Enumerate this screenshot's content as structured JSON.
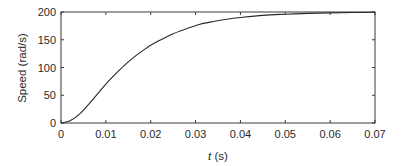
{
  "chart_data": {
    "type": "line",
    "title": "",
    "xlabel_var": "t",
    "xlabel_unit": " (s)",
    "xlabel": "t (s)",
    "ylabel": "Speed (rad/s)",
    "xlim": [
      0,
      0.07
    ],
    "ylim": [
      0,
      200
    ],
    "grid": false,
    "legend": null,
    "x_ticks": [
      0,
      0.01,
      0.02,
      0.03,
      0.04,
      0.05,
      0.06,
      0.07
    ],
    "x_tick_labels": [
      "0",
      "0.01",
      "0.02",
      "0.03",
      "0.04",
      "0.05",
      "0.06",
      "0.07"
    ],
    "y_ticks": [
      0,
      50,
      100,
      150,
      200
    ],
    "y_tick_labels": [
      "0",
      "50",
      "100",
      "150",
      "200"
    ],
    "series": [
      {
        "name": "Speed",
        "color": "#2a2a2a",
        "x": [
          0,
          0.002,
          0.004,
          0.006,
          0.008,
          0.01,
          0.012,
          0.014,
          0.016,
          0.018,
          0.02,
          0.022,
          0.025,
          0.028,
          0.031,
          0.034,
          0.037,
          0.04,
          0.045,
          0.05,
          0.055,
          0.06,
          0.065,
          0.07
        ],
        "values": [
          0,
          4,
          15,
          32,
          51,
          70,
          87,
          103,
          117,
          129,
          140,
          149,
          161,
          170,
          178,
          183,
          187,
          190,
          194,
          196,
          197.5,
          198.5,
          199,
          199.5
        ]
      }
    ]
  }
}
